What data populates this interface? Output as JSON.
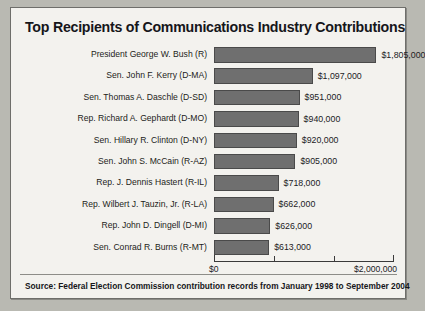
{
  "chart_data": {
    "type": "bar",
    "orientation": "horizontal",
    "title": "Top Recipients of Communications Industry Contributions",
    "xlabel": "",
    "ylabel": "",
    "xlim": [
      0,
      2000000
    ],
    "grid": false,
    "legend": false,
    "axis_tick_labels": [
      "$0",
      "$2,000,000"
    ],
    "axis_tick_values": [
      0,
      2000000
    ],
    "categories": [
      "President George W. Bush (R)",
      "Sen. John F. Kerry (D-MA)",
      "Sen. Thomas A. Daschle (D-SD)",
      "Rep. Richard A. Gephardt (D-MO)",
      "Sen. Hillary R. Clinton (D-NY)",
      "Sen. John S. McCain (R-AZ)",
      "Rep. J. Dennis Hastert (R-IL)",
      "Rep. Wilbert J. Tauzin, Jr. (R-LA)",
      "Rep. John D. Dingell (D-MI)",
      "Sen. Conrad R. Burns (R-MT)"
    ],
    "values": [
      1805000,
      1097000,
      951000,
      940000,
      920000,
      905000,
      718000,
      662000,
      626000,
      613000
    ],
    "value_labels": [
      "$1,805,000",
      "$1,097,000",
      "$951,000",
      "$940,000",
      "$920,000",
      "$905,000",
      "$718,000",
      "$662,000",
      "$626,000",
      "$613,000"
    ],
    "bar_color": "#6f6f6f",
    "bar_border_color": "#4a4a4a",
    "background_color": "#f3f2ee"
  },
  "source": {
    "note": "Source: Federal Election Commission contribution records from January 1998 to September 2004"
  }
}
